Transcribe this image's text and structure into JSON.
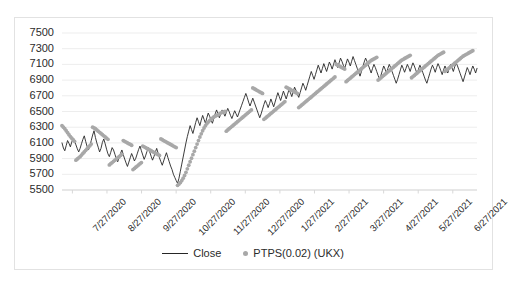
{
  "chart_data": {
    "type": "line",
    "title": "",
    "subtitle": "",
    "xlabel": "",
    "ylabel": "",
    "ylim": [
      5500,
      7500
    ],
    "ytick_step": 200,
    "grid": true,
    "legend_position": "bottom",
    "ytick_labels": [
      "7500",
      "7300",
      "7100",
      "6900",
      "6700",
      "6500",
      "6300",
      "6100",
      "5900",
      "5700",
      "5500"
    ],
    "xtick_labels": [
      "7/27/2020",
      "8/27/2020",
      "9/27/2020",
      "10/27/2020",
      "11/27/2020",
      "12/27/2020",
      "1/27/2021",
      "2/27/2021",
      "3/27/2021",
      "4/27/2021",
      "5/27/2021",
      "6/27/2021"
    ],
    "colors": {
      "close_line": "#262626",
      "psar_dots": "#a8a8a8",
      "grid": "#ededed",
      "border": "#e2e2e2"
    },
    "series": [
      {
        "name": "Close",
        "render": "line",
        "values": [
          6100,
          6035,
          6000,
          6065,
          6130,
          6095,
          6050,
          6110,
          6160,
          6120,
          6075,
          6025,
          5985,
          6030,
          6090,
          6145,
          6190,
          6120,
          6055,
          6010,
          6060,
          6130,
          6200,
          6255,
          6170,
          6100,
          6045,
          5985,
          6030,
          6105,
          6150,
          6090,
          6020,
          5960,
          5925,
          5980,
          6040,
          6010,
          5955,
          5900,
          5860,
          5910,
          5965,
          6010,
          5950,
          5895,
          5845,
          5800,
          5855,
          5910,
          5965,
          5920,
          5870,
          5905,
          5960,
          6015,
          6060,
          6000,
          5945,
          5890,
          5935,
          5990,
          6040,
          5985,
          5930,
          5880,
          5925,
          5980,
          6030,
          5970,
          5910,
          5860,
          5815,
          5870,
          5925,
          5975,
          5915,
          5860,
          5805,
          5760,
          5700,
          5660,
          5620,
          5585,
          5650,
          5740,
          5830,
          5920,
          6010,
          6100,
          6180,
          6250,
          6320,
          6270,
          6220,
          6290,
          6360,
          6420,
          6370,
          6320,
          6390,
          6450,
          6400,
          6350,
          6420,
          6480,
          6440,
          6390,
          6350,
          6410,
          6470,
          6520,
          6470,
          6420,
          6470,
          6520,
          6480,
          6440,
          6490,
          6540,
          6500,
          6450,
          6410,
          6460,
          6510,
          6470,
          6430,
          6480,
          6530,
          6580,
          6630,
          6680,
          6730,
          6680,
          6620,
          6570,
          6620,
          6670,
          6620,
          6570,
          6520,
          6470,
          6420,
          6470,
          6530,
          6590,
          6640,
          6600,
          6550,
          6600,
          6660,
          6610,
          6560,
          6620,
          6680,
          6740,
          6690,
          6640,
          6700,
          6760,
          6710,
          6660,
          6720,
          6780,
          6740,
          6690,
          6750,
          6810,
          6770,
          6720,
          6680,
          6740,
          6800,
          6860,
          6820,
          6770,
          6830,
          6890,
          6950,
          7010,
          6960,
          6910,
          6970,
          7030,
          7090,
          7040,
          6990,
          7050,
          7110,
          7060,
          7010,
          7070,
          7130,
          7090,
          7040,
          7100,
          7160,
          7110,
          7060,
          7120,
          7180,
          7140,
          7090,
          7050,
          7110,
          7170,
          7130,
          7080,
          7140,
          7200,
          7150,
          7100,
          7050,
          7000,
          6950,
          7010,
          7070,
          7130,
          7180,
          7140,
          7090,
          7040,
          6990,
          7050,
          7100,
          7060,
          7010,
          6960,
          6910,
          6960,
          7020,
          7080,
          7040,
          6990,
          7050,
          7100,
          7060,
          7010,
          6960,
          6910,
          6860,
          6910,
          6970,
          7030,
          7090,
          7050,
          7000,
          7050,
          7100,
          7060,
          7010,
          7070,
          7120,
          7080,
          7030,
          6980,
          7040,
          7090,
          7050,
          7000,
          6950,
          6900,
          6860,
          6920,
          6980,
          7040,
          7090,
          7050,
          7000,
          7060,
          7110,
          7070,
          7020,
          6970,
          7030,
          7080,
          7040,
          6990,
          7050,
          7100,
          7060,
          7010,
          7070,
          7120,
          7080,
          7030,
          6980,
          6930,
          6880,
          6940,
          7000,
          7060,
          7020,
          6970,
          7030,
          7080,
          7040,
          6990,
          7050
        ]
      },
      {
        "name": "PTPS(0.02) (UKX)",
        "render": "dots",
        "values": [
          6320,
          6300,
          6280,
          6255,
          6230,
          6205,
          6180,
          6160,
          6140,
          6120,
          5880,
          5895,
          5910,
          5925,
          5945,
          5965,
          5985,
          6005,
          6025,
          6045,
          6065,
          6085,
          6300,
          6290,
          6280,
          6265,
          6250,
          6235,
          6220,
          6205,
          6190,
          6175,
          6160,
          6145,
          5820,
          5835,
          5850,
          5865,
          5880,
          5895,
          5910,
          5925,
          5940,
          5955,
          6130,
          6120,
          6110,
          6100,
          6090,
          6080,
          6070,
          5760,
          5775,
          5790,
          5805,
          5820,
          5835,
          5850,
          6060,
          6050,
          6040,
          6030,
          6020,
          6010,
          6000,
          5990,
          5980,
          5970,
          5960,
          5950,
          5940,
          6150,
          6140,
          6130,
          6120,
          6110,
          6100,
          6090,
          6080,
          6070,
          6060,
          6050,
          6040,
          5560,
          5575,
          5595,
          5620,
          5650,
          5685,
          5725,
          5770,
          5815,
          5860,
          5905,
          5950,
          5995,
          6040,
          6085,
          6130,
          6175,
          6215,
          6255,
          6290,
          6320,
          6345,
          6365,
          6385,
          6400,
          6415,
          6430,
          6440,
          6450,
          6460,
          6470,
          6480,
          6490,
          6495,
          6500,
          6250,
          6265,
          6280,
          6295,
          6310,
          6325,
          6340,
          6355,
          6370,
          6385,
          6400,
          6415,
          6430,
          6445,
          6460,
          6475,
          6490,
          6505,
          6520,
          6800,
          6790,
          6780,
          6770,
          6760,
          6750,
          6740,
          6730,
          6400,
          6415,
          6430,
          6445,
          6460,
          6475,
          6490,
          6505,
          6520,
          6535,
          6550,
          6565,
          6580,
          6595,
          6610,
          6625,
          6810,
          6800,
          6790,
          6780,
          6770,
          6760,
          6750,
          6740,
          6730,
          6550,
          6565,
          6580,
          6595,
          6610,
          6625,
          6640,
          6655,
          6670,
          6685,
          6700,
          6715,
          6730,
          6745,
          6760,
          6775,
          6790,
          6805,
          6820,
          6835,
          6850,
          6865,
          6880,
          6895,
          6910,
          6925,
          6940,
          7100,
          7090,
          7080,
          7070,
          7060,
          7050,
          7040,
          6880,
          6895,
          6910,
          6925,
          6940,
          6955,
          6970,
          6985,
          7000,
          7015,
          7030,
          7045,
          7060,
          7075,
          7090,
          7105,
          7120,
          7135,
          7150,
          7160,
          7170,
          7180,
          7190,
          6900,
          6915,
          6930,
          6945,
          6960,
          6975,
          6990,
          7005,
          7020,
          7035,
          7050,
          7065,
          7080,
          7095,
          7110,
          7125,
          7140,
          7155,
          7165,
          7175,
          7185,
          7195,
          7205,
          7215,
          6930,
          6945,
          6960,
          6975,
          6990,
          7005,
          7020,
          7035,
          7050,
          7065,
          7080,
          7095,
          7110,
          7125,
          7140,
          7155,
          7170,
          7185,
          7200,
          7215,
          7225,
          7235,
          7245,
          7255,
          7010,
          7025,
          7040,
          7055,
          7070,
          7085,
          7100,
          7115,
          7130,
          7145,
          7160,
          7175,
          7190,
          7205,
          7215,
          7225,
          7235,
          7245,
          7255,
          7265,
          7275
        ]
      }
    ]
  },
  "legend": {
    "items": [
      {
        "label": "Close",
        "marker": "line-marker"
      },
      {
        "label": "PTPS(0.02) (UKX)",
        "marker": "dot-marker"
      }
    ]
  }
}
